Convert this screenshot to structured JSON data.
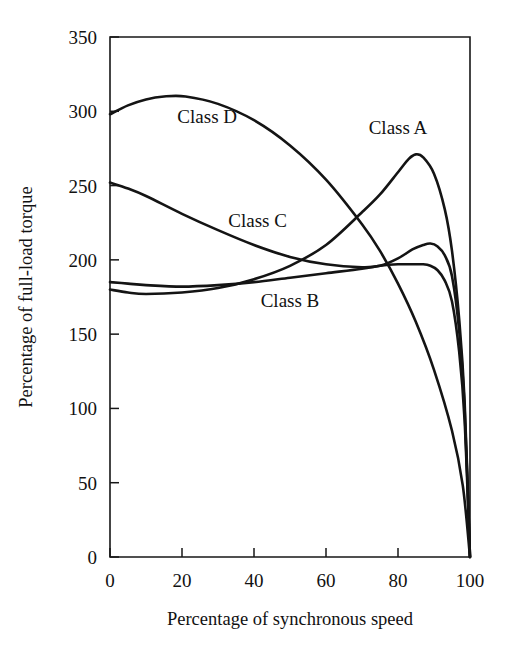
{
  "chart_data": {
    "type": "line",
    "title": "",
    "xlabel": "Percentage of synchronous speed",
    "ylabel": "Percentage of full-load torque",
    "xlim": [
      0,
      100
    ],
    "ylim": [
      0,
      350
    ],
    "xticks": [
      "0",
      "20",
      "40",
      "60",
      "80",
      "100"
    ],
    "xtick_values": [
      0,
      20,
      40,
      60,
      80,
      100
    ],
    "yticks": [
      "0",
      "50",
      "100",
      "150",
      "200",
      "250",
      "300",
      "350"
    ],
    "ytick_values": [
      0,
      50,
      100,
      150,
      200,
      250,
      300,
      350
    ],
    "grid": false,
    "legend": "inline-labels",
    "line_color": "#141414",
    "background_color": "#ffffff",
    "series": [
      {
        "name": "Class A",
        "label": "Class A",
        "label_x": 80,
        "label_y": 285,
        "x": [
          0,
          5,
          10,
          20,
          30,
          40,
          50,
          60,
          70,
          75,
          80,
          83,
          85,
          87,
          90,
          93,
          95,
          97,
          98.5,
          100
        ],
        "values": [
          180,
          178,
          177,
          178,
          181,
          187,
          196,
          210,
          232,
          244,
          259,
          268,
          271,
          269,
          258,
          234,
          206,
          160,
          105,
          0
        ]
      },
      {
        "name": "Class B",
        "label": "Class B",
        "label_x": 50,
        "label_y": 168,
        "x": [
          0,
          5,
          10,
          20,
          30,
          40,
          50,
          60,
          70,
          75,
          80,
          84,
          87,
          89,
          91,
          93,
          95,
          97,
          98.5,
          100
        ],
        "values": [
          185,
          184,
          183,
          182,
          183,
          185,
          188,
          191,
          194,
          196,
          197,
          197,
          197,
          196,
          193,
          186,
          172,
          138,
          92,
          0
        ]
      },
      {
        "name": "Class C",
        "label": "Class C",
        "label_x": 41,
        "label_y": 222,
        "x": [
          0,
          5,
          10,
          20,
          30,
          40,
          50,
          60,
          70,
          75,
          80,
          84,
          87,
          89,
          91,
          93,
          95,
          97,
          98.5,
          100
        ],
        "values": [
          252,
          248,
          243,
          231,
          220,
          210,
          202,
          197,
          195,
          196,
          201,
          207,
          210,
          211,
          209,
          203,
          189,
          152,
          100,
          0
        ]
      },
      {
        "name": "Class D",
        "label": "Class D",
        "label_x": 27,
        "label_y": 292,
        "x": [
          0,
          5,
          10,
          15,
          21,
          30,
          40,
          50,
          60,
          70,
          75,
          80,
          85,
          90,
          95,
          98,
          100
        ],
        "values": [
          298,
          304,
          308,
          310,
          310,
          305,
          294,
          277,
          254,
          224,
          206,
          184,
          158,
          126,
          85,
          48,
          0
        ]
      }
    ]
  },
  "plot_geometry": {
    "left": 110,
    "right": 470,
    "top": 37,
    "bottom": 557
  }
}
